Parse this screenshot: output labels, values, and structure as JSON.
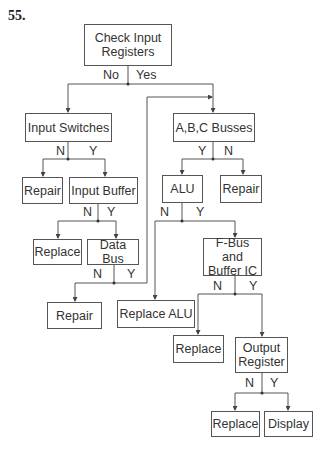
{
  "problem_number": "55.",
  "nodes": {
    "check_input_registers": "Check Input\nRegisters",
    "input_switches": "Input Switches",
    "abc_busses": "A,B,C Busses",
    "repair_1": "Repair",
    "input_buffer": "Input Buffer",
    "alu": "ALU",
    "repair_2": "Repair",
    "replace_1": "Replace",
    "data_bus": "Data Bus",
    "fbus_buffer_ic": "F-Bus and\nBuffer IC",
    "repair_3": "Repair",
    "replace_alu": "Replace ALU",
    "replace_2": "Replace",
    "output_register": "Output\nRegister",
    "replace_3": "Replace",
    "display": "Display"
  },
  "edge_labels": {
    "check_no": "No",
    "check_yes": "Yes",
    "switches_n": "N",
    "switches_y": "Y",
    "busses_y": "Y",
    "busses_n": "N",
    "buffer_n": "N",
    "buffer_y": "Y",
    "alu_n": "N",
    "alu_y": "Y",
    "databus_n": "N",
    "databus_y": "Y",
    "fbus_n": "N",
    "fbus_y": "Y",
    "output_n": "N",
    "output_y": "Y"
  }
}
